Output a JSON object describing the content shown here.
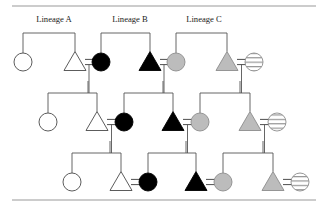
{
  "figure": {
    "name": "pedigree-diagram",
    "title": "",
    "top_rule": true,
    "bottom_rule": true,
    "colors": {
      "open_fill": "#ffffff",
      "filled_fill": "#000000",
      "gray_fill": "#bcbcbc",
      "hatch_fill": "#ffffff",
      "outline": "#4a4a4a",
      "line": "#555555",
      "rule": "#9a9a9a",
      "text": "#1c1c1c"
    }
  },
  "labels": [
    {
      "text": "Lineage A",
      "x": 54,
      "y": 22
    },
    {
      "text": "Lineage B",
      "x": 130,
      "y": 22
    },
    {
      "text": "Lineage C",
      "x": 204,
      "y": 22
    }
  ],
  "legend_keys": {
    "circle": "female",
    "triangle": "male",
    "open": "unaffected",
    "filled": "affected",
    "gray": "partially-affected",
    "hatched": "carrier",
    "equals": "mating-line",
    "bar": "sibship-line"
  },
  "generations": [
    {
      "id": "generation-1",
      "row_y": 62,
      "sib_bar_y": 33
    },
    {
      "id": "generation-2",
      "row_y": 122,
      "sib_bar_y": 93
    },
    {
      "id": "generation-3",
      "row_y": 182,
      "sib_bar_y": 153
    }
  ],
  "symbols": [
    {
      "id": "g1-s1",
      "shape": "circle",
      "fill": "open",
      "cx": 23,
      "cy": 62,
      "gen": 1
    },
    {
      "id": "g1-s2",
      "shape": "triangle",
      "fill": "open",
      "cx": 75,
      "cy": 62,
      "gen": 1
    },
    {
      "id": "g1-s3",
      "shape": "circle",
      "fill": "filled",
      "cx": 101,
      "cy": 62,
      "gen": 1
    },
    {
      "id": "g1-s4",
      "shape": "triangle",
      "fill": "filled",
      "cx": 150,
      "cy": 62,
      "gen": 1
    },
    {
      "id": "g1-s5",
      "shape": "circle",
      "fill": "gray",
      "cx": 176,
      "cy": 62,
      "gen": 1
    },
    {
      "id": "g1-s6",
      "shape": "triangle",
      "fill": "gray",
      "cx": 227,
      "cy": 62,
      "gen": 1
    },
    {
      "id": "g1-s7",
      "shape": "circle",
      "fill": "hatch",
      "cx": 254,
      "cy": 62,
      "gen": 1
    },
    {
      "id": "g2-s1",
      "shape": "circle",
      "fill": "open",
      "cx": 48,
      "cy": 122,
      "gen": 2
    },
    {
      "id": "g2-s2",
      "shape": "triangle",
      "fill": "open",
      "cx": 97,
      "cy": 122,
      "gen": 2
    },
    {
      "id": "g2-s3",
      "shape": "circle",
      "fill": "filled",
      "cx": 124,
      "cy": 122,
      "gen": 2
    },
    {
      "id": "g2-s4",
      "shape": "triangle",
      "fill": "filled",
      "cx": 173,
      "cy": 122,
      "gen": 2
    },
    {
      "id": "g2-s5",
      "shape": "circle",
      "fill": "gray",
      "cx": 200,
      "cy": 122,
      "gen": 2
    },
    {
      "id": "g2-s6",
      "shape": "triangle",
      "fill": "gray",
      "cx": 250,
      "cy": 122,
      "gen": 2
    },
    {
      "id": "g2-s7",
      "shape": "circle",
      "fill": "hatch",
      "cx": 277,
      "cy": 122,
      "gen": 2
    },
    {
      "id": "g3-s1",
      "shape": "circle",
      "fill": "open",
      "cx": 72,
      "cy": 182,
      "gen": 3
    },
    {
      "id": "g3-s2",
      "shape": "triangle",
      "fill": "open",
      "cx": 121,
      "cy": 182,
      "gen": 3
    },
    {
      "id": "g3-s3",
      "shape": "circle",
      "fill": "filled",
      "cx": 148,
      "cy": 182,
      "gen": 3
    },
    {
      "id": "g3-s4",
      "shape": "triangle",
      "fill": "filled",
      "cx": 196,
      "cy": 182,
      "gen": 3
    },
    {
      "id": "g3-s5",
      "shape": "circle",
      "fill": "gray",
      "cx": 223,
      "cy": 182,
      "gen": 3
    },
    {
      "id": "g3-s6",
      "shape": "triangle",
      "fill": "gray",
      "cx": 273,
      "cy": 182,
      "gen": 3
    },
    {
      "id": "g3-s7",
      "shape": "circle",
      "fill": "hatch",
      "cx": 300,
      "cy": 182,
      "gen": 3
    }
  ],
  "matings": [
    {
      "id": "m-g1-a",
      "left_cx": 75,
      "right_cx": 101,
      "y": 62,
      "drop_to": 93
    },
    {
      "id": "m-g1-b",
      "left_cx": 150,
      "right_cx": 176,
      "y": 62,
      "drop_to": 93
    },
    {
      "id": "m-g1-c",
      "left_cx": 227,
      "right_cx": 254,
      "y": 62,
      "drop_to": 93
    },
    {
      "id": "m-g2-a",
      "left_cx": 97,
      "right_cx": 124,
      "y": 122,
      "drop_to": 153
    },
    {
      "id": "m-g2-b",
      "left_cx": 173,
      "right_cx": 200,
      "y": 122,
      "drop_to": 153
    },
    {
      "id": "m-g2-c",
      "left_cx": 250,
      "right_cx": 277,
      "y": 122,
      "drop_to": 153
    },
    {
      "id": "m-g3-a",
      "left_cx": 121,
      "right_cx": 148,
      "y": 182,
      "drop_to": 182
    },
    {
      "id": "m-g3-b",
      "left_cx": 196,
      "right_cx": 223,
      "y": 182,
      "drop_to": 182
    },
    {
      "id": "m-g3-c",
      "left_cx": 273,
      "right_cx": 300,
      "y": 182,
      "drop_to": 182
    }
  ],
  "sibships": [
    {
      "id": "sib-g1-a",
      "bar_y": 33,
      "left_cx": 23,
      "right_cx": 75,
      "stem_from": null,
      "children_y": 62
    },
    {
      "id": "sib-g1-b",
      "bar_y": 33,
      "left_cx": 101,
      "right_cx": 150,
      "stem_from": null,
      "children_y": 62
    },
    {
      "id": "sib-g1-c",
      "bar_y": 33,
      "left_cx": 176,
      "right_cx": 227,
      "stem_from": null,
      "children_y": 62
    },
    {
      "id": "sib-g2-a",
      "bar_y": 93,
      "left_cx": 48,
      "right_cx": 97,
      "stem_from": 88,
      "children_y": 122
    },
    {
      "id": "sib-g2-b",
      "bar_y": 93,
      "left_cx": 124,
      "right_cx": 173,
      "stem_from": 163,
      "children_y": 122
    },
    {
      "id": "sib-g2-c",
      "bar_y": 93,
      "left_cx": 200,
      "right_cx": 250,
      "stem_from": 240,
      "children_y": 122
    },
    {
      "id": "sib-g3-a",
      "bar_y": 153,
      "left_cx": 72,
      "right_cx": 121,
      "stem_from": 110,
      "children_y": 182
    },
    {
      "id": "sib-g3-b",
      "bar_y": 153,
      "left_cx": 148,
      "right_cx": 196,
      "stem_from": 186,
      "children_y": 182
    },
    {
      "id": "sib-g3-c",
      "bar_y": 153,
      "left_cx": 223,
      "right_cx": 273,
      "stem_from": 263,
      "children_y": 182
    }
  ],
  "rules": [
    {
      "id": "top-rule",
      "x1": 12,
      "x2": 316,
      "y": 6
    },
    {
      "id": "bottom-rule",
      "x1": 12,
      "x2": 316,
      "y": 200
    }
  ],
  "geometry": {
    "circle_r": 9,
    "triangle_half_w": 11,
    "triangle_h": 17,
    "equals_gap": 2.6
  }
}
